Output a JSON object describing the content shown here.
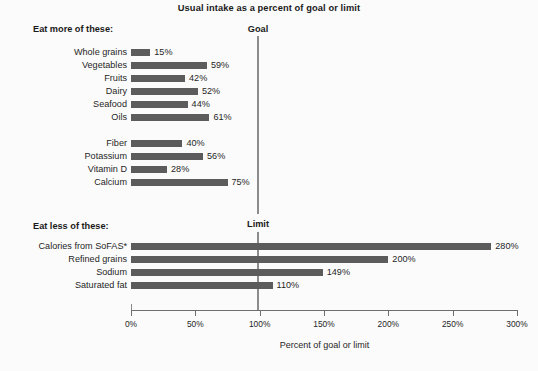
{
  "chart_data": {
    "type": "bar",
    "orientation": "horizontal",
    "title": "Usual intake as a percent of goal or limit",
    "xlabel": "Percent of goal or limit",
    "ylabel": "",
    "xlim": [
      0,
      300
    ],
    "xticks": [
      "0%",
      "50%",
      "100%",
      "150%",
      "200%",
      "250%",
      "300%"
    ],
    "xtick_values": [
      0,
      50,
      100,
      150,
      200,
      250,
      300
    ],
    "grid": false,
    "legend": null,
    "bar_color": "#5c5c5c",
    "reference_lines": [
      {
        "label": "Goal",
        "value": 100
      },
      {
        "label": "Limit",
        "value": 100
      }
    ],
    "groups": [
      {
        "header": "Eat more of these:",
        "subgroups": [
          {
            "categories": [
              "Whole grains",
              "Vegetables",
              "Fruits",
              "Dairy",
              "Seafood",
              "Oils"
            ],
            "values": [
              15,
              59,
              42,
              52,
              44,
              61
            ],
            "labels": [
              "15%",
              "59%",
              "42%",
              "52%",
              "44%",
              "61%"
            ]
          },
          {
            "categories": [
              "Fiber",
              "Potassium",
              "Vitamin D",
              "Calcium"
            ],
            "values": [
              40,
              56,
              28,
              75
            ],
            "labels": [
              "40%",
              "56%",
              "28%",
              "75%"
            ]
          }
        ]
      },
      {
        "header": "Eat less of these:",
        "subgroups": [
          {
            "categories": [
              "Calories from SoFAS*",
              "Refined grains",
              "Sodium",
              "Saturated fat"
            ],
            "values": [
              280,
              200,
              149,
              110
            ],
            "labels": [
              "280%",
              "200%",
              "149%",
              "110%"
            ]
          }
        ]
      }
    ]
  }
}
